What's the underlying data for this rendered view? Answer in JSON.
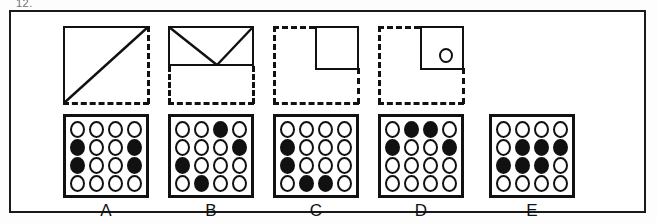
{
  "item_number": "12.",
  "panel": {
    "border_color": "#111111",
    "background": "#ffffff"
  },
  "stimulus_shapes": [
    {
      "id": "shape-a",
      "description": "square with solid top and left edges, dashed right and bottom edges, solid diagonal from bottom-left to top-right",
      "solid_edges": [
        "top",
        "left"
      ],
      "dashed_edges": [
        "right",
        "bottom"
      ],
      "diagonal": "bottom-left-to-top-right",
      "inner": "none"
    },
    {
      "id": "shape-b",
      "description": "upper half solid rectangle containing a downward triangle, lower half dashed square outline",
      "solid_edges": [
        "top",
        "left-upper",
        "right-upper",
        "mid-horizontal"
      ],
      "dashed_edges": [
        "left-lower",
        "right-lower",
        "bottom"
      ],
      "diagonal": "none",
      "inner": "downward-triangle"
    },
    {
      "id": "shape-c",
      "description": "dashed square with a small solid square in the top-right quadrant",
      "solid_edges": [],
      "dashed_edges": [
        "top-left",
        "left",
        "bottom",
        "right-lower"
      ],
      "diagonal": "none",
      "inner": "solid-square-top-right"
    },
    {
      "id": "shape-d",
      "description": "dashed square with a small solid square in the top-right quadrant containing a small circle",
      "solid_edges": [],
      "dashed_edges": [
        "top-left",
        "left",
        "bottom",
        "right-lower"
      ],
      "diagonal": "none",
      "inner": "solid-square-top-right-with-circle"
    }
  ],
  "answer_options": [
    {
      "label": "A",
      "rows": 4,
      "cols": 4,
      "filled_count": 4,
      "pattern": [
        [
          0,
          0,
          0,
          0
        ],
        [
          1,
          0,
          0,
          1
        ],
        [
          1,
          0,
          0,
          1
        ],
        [
          0,
          0,
          0,
          0
        ]
      ]
    },
    {
      "label": "B",
      "rows": 4,
      "cols": 4,
      "filled_count": 4,
      "pattern": [
        [
          0,
          0,
          1,
          0
        ],
        [
          0,
          0,
          0,
          1
        ],
        [
          1,
          0,
          0,
          0
        ],
        [
          0,
          1,
          0,
          0
        ]
      ]
    },
    {
      "label": "C",
      "rows": 4,
      "cols": 4,
      "filled_count": 4,
      "pattern": [
        [
          0,
          0,
          0,
          0
        ],
        [
          1,
          0,
          0,
          0
        ],
        [
          1,
          0,
          0,
          0
        ],
        [
          0,
          1,
          1,
          0
        ]
      ]
    },
    {
      "label": "D",
      "rows": 4,
      "cols": 4,
      "filled_count": 4,
      "pattern": [
        [
          0,
          1,
          1,
          0
        ],
        [
          1,
          0,
          0,
          1
        ],
        [
          0,
          0,
          0,
          0
        ],
        [
          0,
          0,
          0,
          0
        ]
      ]
    },
    {
      "label": "E",
      "rows": 4,
      "cols": 4,
      "filled_count": 6,
      "pattern": [
        [
          0,
          0,
          0,
          0
        ],
        [
          0,
          1,
          1,
          1
        ],
        [
          1,
          1,
          1,
          0
        ],
        [
          0,
          0,
          0,
          0
        ]
      ]
    }
  ],
  "colors": {
    "ink": "#111111",
    "paper": "#ffffff",
    "faint_text": "#6f6f6f"
  }
}
